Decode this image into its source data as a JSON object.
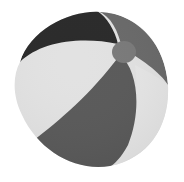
{
  "image": {
    "subject": "beach ball",
    "style": "grayscale photo",
    "background": "#ffffff",
    "colors": {
      "dark_panel": "#2a2a2a",
      "mid_panel": "#5a5a5a",
      "light_panel": "#e2e2e2",
      "gray_panel": "#9a9a9a",
      "cap": "#7a7a7a"
    }
  }
}
